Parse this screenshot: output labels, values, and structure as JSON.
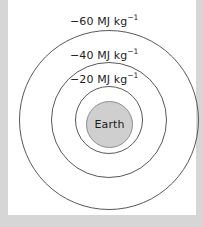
{
  "figure": {
    "type": "gravitational-equipotential-diagram",
    "background_color": "#d6d6d6",
    "panel_color": "#ffffff",
    "line_color": "#58585a",
    "body": {
      "name": "earth-body",
      "label": "Earth",
      "fill_color": "#cfcfcf",
      "stroke_color": "#8e8e90"
    },
    "equipotentials": [
      {
        "id": "equipotential-60",
        "value": "−60",
        "unit_mantissa": "MJ kg",
        "unit_exponent": "−1",
        "full_label": "−60 MJ kg−1",
        "radius_rank": 3
      },
      {
        "id": "equipotential-40",
        "value": "−40",
        "unit_mantissa": "MJ kg",
        "unit_exponent": "−1",
        "full_label": "−40 MJ kg−1",
        "radius_rank": 2
      },
      {
        "id": "equipotential-20",
        "value": "−20",
        "unit_mantissa": "MJ kg",
        "unit_exponent": "−1",
        "full_label": "−20 MJ kg−1",
        "radius_rank": 1
      }
    ]
  }
}
